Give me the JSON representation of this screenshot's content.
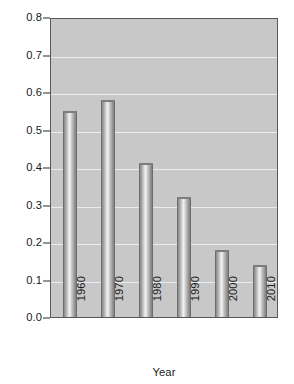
{
  "chart_data": {
    "type": "bar",
    "title": "",
    "subtitle": "",
    "xlabel": "Year",
    "ylabel": "Ozone level (parts per million)",
    "categories": [
      "1960",
      "1970",
      "1980",
      "1990",
      "2000",
      "2010"
    ],
    "values": [
      0.55,
      0.58,
      0.41,
      0.32,
      0.18,
      0.14
    ],
    "series": [
      {
        "name": "Ozone level",
        "values": [
          0.55,
          0.58,
          0.41,
          0.32,
          0.18,
          0.14
        ]
      }
    ],
    "ylim": [
      0.0,
      0.8
    ],
    "ytick_labels": [
      "0.0",
      "0.1",
      "0.2",
      "0.3",
      "0.4",
      "0.5",
      "0.6",
      "0.7",
      "0.8"
    ],
    "ytick_values": [
      0.0,
      0.1,
      0.2,
      0.3,
      0.4,
      0.5,
      0.6,
      0.7,
      0.8
    ],
    "grid": "horizontal",
    "legend": "none",
    "annotations": [],
    "style": {
      "plot_background": "#c8c8c8",
      "gridline_color": "#eeeeee",
      "bar_fill_light": "#f1f1f1",
      "bar_fill_dark": "#808080",
      "axis_color": "#575757",
      "text_color": "#1a1a1a",
      "page_background": "#ffffff"
    }
  }
}
